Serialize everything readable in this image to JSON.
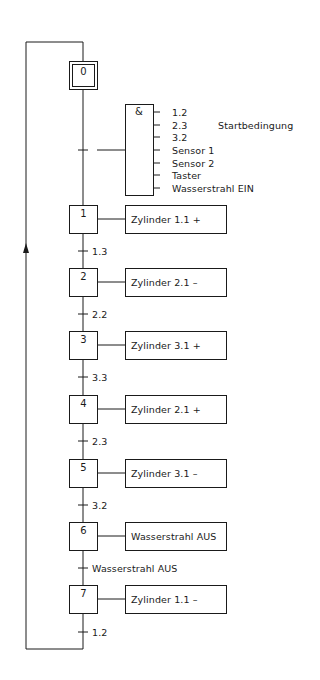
{
  "diagram": {
    "type": "GRAFCET sequential function chart",
    "initial_step": {
      "id": "0"
    },
    "start_condition": {
      "operator": "&",
      "label": "Startbedingung",
      "inputs": [
        "1.2",
        "2.3",
        "3.2",
        "Sensor 1",
        "Sensor 2",
        "Taster",
        "Wasserstrahl EIN"
      ]
    },
    "steps": [
      {
        "id": "1",
        "action": "Zylinder 1.1 +",
        "transition": "1.3"
      },
      {
        "id": "2",
        "action": "Zylinder 2.1 –",
        "transition": "2.2"
      },
      {
        "id": "3",
        "action": "Zylinder 3.1 +",
        "transition": "3.3"
      },
      {
        "id": "4",
        "action": "Zylinder 2.1 +",
        "transition": "2.3"
      },
      {
        "id": "5",
        "action": "Zylinder 3.1 –",
        "transition": "3.2"
      },
      {
        "id": "6",
        "action": "Wasserstrahl AUS",
        "transition": "Wasserstrahl AUS"
      },
      {
        "id": "7",
        "action": "Zylinder 1.1 –",
        "transition": "1.2"
      }
    ]
  }
}
